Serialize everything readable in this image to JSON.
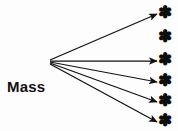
{
  "diagram": {
    "type": "one-step-flow-communication-model",
    "background_color": "#fdfdfd",
    "ink_color": "#111111",
    "source": {
      "line1": "Mass",
      "line2": "Media",
      "origin_x": 49,
      "origin_y": 61
    },
    "receiver_icon": "asterisk-star-icon",
    "receiver_glyph": "✽",
    "receivers": [
      {
        "id": "receiver-1",
        "x": 165,
        "y": 13,
        "has_arrow": true
      },
      {
        "id": "receiver-2",
        "x": 165,
        "y": 37,
        "has_arrow": false
      },
      {
        "id": "receiver-3",
        "x": 165,
        "y": 60,
        "has_arrow": true
      },
      {
        "id": "receiver-4",
        "x": 165,
        "y": 81,
        "has_arrow": true
      },
      {
        "id": "receiver-5",
        "x": 165,
        "y": 101,
        "has_arrow": true
      },
      {
        "id": "receiver-6",
        "x": 165,
        "y": 121,
        "has_arrow": true
      }
    ],
    "arrows": [
      {
        "id": "arrow-1",
        "x1": 50,
        "y1": 60,
        "x2": 157,
        "y2": 14
      },
      {
        "id": "arrow-2",
        "x1": 50,
        "y1": 61,
        "x2": 157,
        "y2": 61
      },
      {
        "id": "arrow-3",
        "x1": 50,
        "y1": 62,
        "x2": 157,
        "y2": 82
      },
      {
        "id": "arrow-4",
        "x1": 50,
        "y1": 63,
        "x2": 157,
        "y2": 102
      },
      {
        "id": "arrow-5",
        "x1": 50,
        "y1": 64,
        "x2": 157,
        "y2": 122
      }
    ]
  }
}
